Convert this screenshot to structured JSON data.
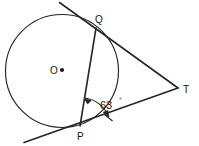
{
  "figure": {
    "stroke_color": "#262626",
    "background_color": "#ffffff",
    "text_color": "#161616"
  },
  "circle": {
    "center_label": "O",
    "center_x": 62,
    "center_y": 71,
    "radius": 57
  },
  "points": {
    "q": {
      "label": "Q",
      "x": 96,
      "y": 28,
      "label_x": 95,
      "label_y": 22,
      "role": "tangent-point-upper"
    },
    "p": {
      "label": "P",
      "x": 80,
      "y": 126,
      "label_x": 78,
      "label_y": 139,
      "role": "tangent-point-lower"
    },
    "t": {
      "label": "T",
      "x": 178,
      "y": 88,
      "label_x": 182,
      "label_y": 92,
      "role": "external-intersection"
    }
  },
  "angle": {
    "value": "63",
    "degree_symbol": "°",
    "full_label": "63°",
    "at_vertex": "P",
    "between": "chord PQ and tangent PT",
    "label_x": 101,
    "label_y": 108
  },
  "segments": [
    {
      "name": "chord-pq",
      "from": "Q",
      "to": "P"
    },
    {
      "name": "tangent-qt",
      "from": "Q",
      "to": "T"
    },
    {
      "name": "tangent-pt",
      "from": "P",
      "to": "T"
    },
    {
      "name": "tangent-q-extension",
      "from": "Q",
      "to": "upper-left-edge"
    },
    {
      "name": "tangent-p-extension",
      "from": "P",
      "to": "lower-left-edge"
    }
  ],
  "canvas": {
    "width": 199,
    "height": 146
  }
}
